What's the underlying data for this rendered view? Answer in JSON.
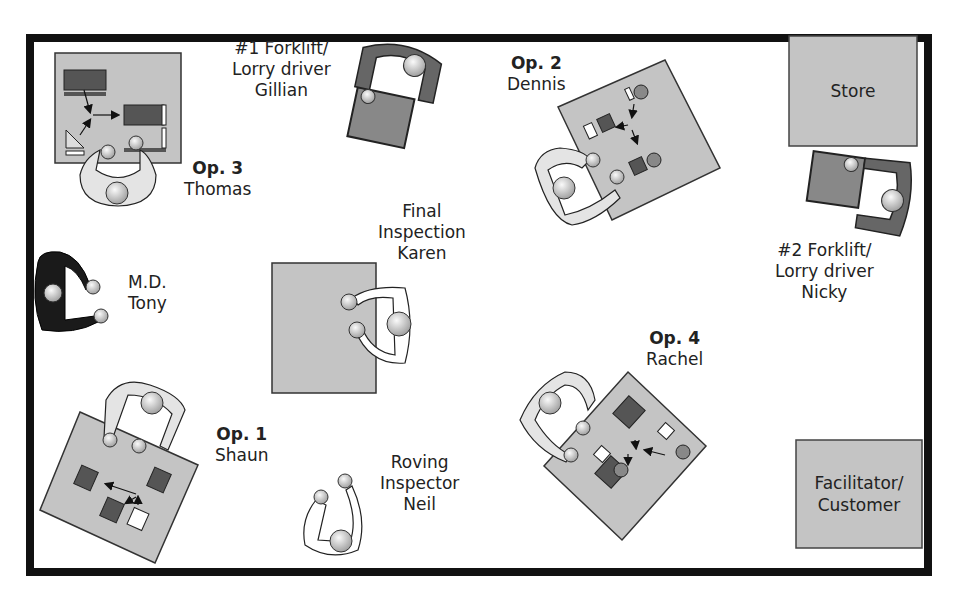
{
  "diagram": {
    "type": "factory-floor-layout",
    "colors": {
      "border": "#111111",
      "table": "#c4c4c4",
      "dark_part": "#555555",
      "forklift": "#666666",
      "person": "#d8d8d8",
      "md_person": "#1a1a1a"
    }
  },
  "areas": {
    "store": {
      "label": "Store"
    },
    "facilitator": {
      "label_line1": "Facilitator/",
      "label_line2": "Customer"
    }
  },
  "stations": {
    "op3": {
      "role": "Op. 3",
      "name": "Thomas"
    },
    "op2": {
      "role": "Op. 2",
      "name": "Dennis"
    },
    "op1": {
      "role": "Op. 1",
      "name": "Shaun"
    },
    "op4": {
      "role": "Op. 4",
      "name": "Rachel"
    },
    "forklift1": {
      "line1": "#1 Forklift/",
      "line2": "Lorry driver",
      "name": "Gillian"
    },
    "forklift2": {
      "line1": "#2 Forklift/",
      "line2": "Lorry driver",
      "name": "Nicky"
    },
    "final_inspection": {
      "line1": "Final",
      "line2": "Inspection",
      "name": "Karen"
    },
    "md": {
      "role": "M.D.",
      "name": "Tony"
    },
    "roving_inspector": {
      "line1": "Roving",
      "line2": "Inspector",
      "name": "Neil"
    }
  }
}
